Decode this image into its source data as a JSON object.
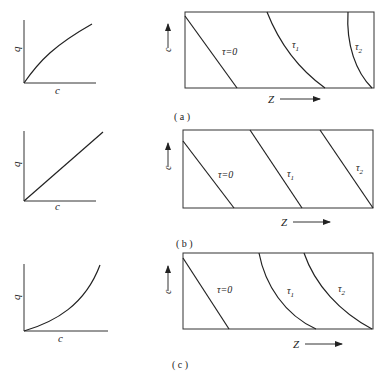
{
  "figure": {
    "panels": [
      {
        "id": "a",
        "caption": "( a )",
        "isotherm": {
          "type": "favorable (concave)",
          "xlabel": "c",
          "ylabel": "q"
        },
        "profile": {
          "xlabel": "Z",
          "ylabel": "c",
          "curves": [
            {
              "label": "τ=0",
              "sub": ""
            },
            {
              "label": "τ",
              "sub": "1"
            },
            {
              "label": "τ",
              "sub": "2"
            }
          ],
          "behavior": "front spreads over time"
        }
      },
      {
        "id": "b",
        "caption": "( b )",
        "isotherm": {
          "type": "linear",
          "xlabel": "c",
          "ylabel": "q"
        },
        "profile": {
          "xlabel": "Z",
          "ylabel": "c",
          "curves": [
            {
              "label": "τ=0",
              "sub": ""
            },
            {
              "label": "τ",
              "sub": "1"
            },
            {
              "label": "τ",
              "sub": "2"
            }
          ],
          "behavior": "front shape constant"
        }
      },
      {
        "id": "c",
        "caption": "( c )",
        "isotherm": {
          "type": "unfavorable (convex)",
          "xlabel": "c",
          "ylabel": "q"
        },
        "profile": {
          "xlabel": "Z",
          "ylabel": "c",
          "curves": [
            {
              "label": "τ=0",
              "sub": ""
            },
            {
              "label": "τ",
              "sub": "1"
            },
            {
              "label": "τ",
              "sub": "2"
            }
          ],
          "behavior": "front sharpens over time"
        }
      }
    ]
  }
}
